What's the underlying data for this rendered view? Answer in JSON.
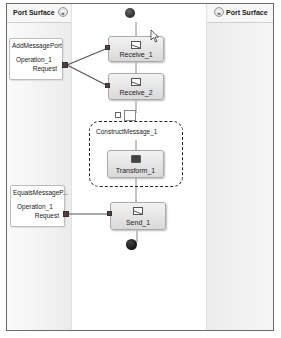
{
  "left_surface": {
    "title": "Port Surface",
    "collapse_glyph": "«"
  },
  "right_surface": {
    "title": "Port Surface",
    "expand_glyph": "»"
  },
  "ports": [
    {
      "name": "AddMessagePort",
      "operation": "Operation_1",
      "message": "Request"
    },
    {
      "name": "EqualsMessageP...",
      "operation": "Operation_1",
      "message": "Request"
    }
  ],
  "shapes": {
    "receive_1": {
      "label": "Receive_1",
      "icon": "envelope-icon"
    },
    "receive_2": {
      "label": "Receive_2",
      "icon": "envelope-icon"
    },
    "construct": {
      "label": "ConstructMessage_1",
      "toggle": "⊟"
    },
    "transform_1": {
      "label": "Transform_1",
      "icon": "transform-icon"
    },
    "send_1": {
      "label": "Send_1",
      "icon": "envelope-icon"
    }
  },
  "colors": {
    "wire": "#555555",
    "port_connector": "#5a3b3b",
    "shape_fill": "#e4e4e4"
  }
}
